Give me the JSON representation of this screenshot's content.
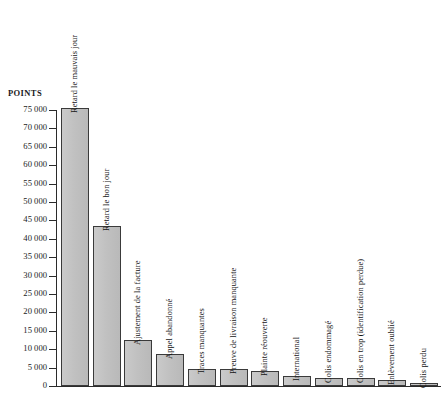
{
  "chart_data": {
    "type": "bar",
    "title": "",
    "subtitle": "",
    "xlabel": "",
    "ylabel": "POINTS",
    "ylim": [
      0,
      75000
    ],
    "ytick_step": 5000,
    "grid": false,
    "legend": null,
    "orientation": "vertical",
    "bar_color": "#c3c3c3",
    "bar_border_color": "#3a3a3a",
    "background_color": "#ffffff",
    "label_rotation": -90,
    "ytick_labels": [
      "0",
      "5 000",
      "10 000",
      "15 000",
      "20 000",
      "25 000",
      "30 000",
      "35 000",
      "40 000",
      "45 000",
      "50 000",
      "55 000",
      "60 000",
      "65 000",
      "70 000",
      "75 000"
    ],
    "ytick_values": [
      0,
      5000,
      10000,
      15000,
      20000,
      25000,
      30000,
      35000,
      40000,
      45000,
      50000,
      55000,
      60000,
      65000,
      70000,
      75000
    ],
    "categories": [
      "Retard le mauvais jour",
      "Retard le bon jour",
      "Ajustement  de la facture",
      "Appel abandonné",
      "Traces manquantes",
      "Preuve de livraison manquante",
      "Plainte réouverte",
      "International",
      "Colis endommagé",
      "Colis en trop (identification perdue)",
      "Enlèvement oublié",
      "Colis perdu"
    ],
    "values": [
      75500,
      43500,
      12500,
      8800,
      4700,
      4700,
      4100,
      2700,
      2200,
      2200,
      1500,
      800
    ]
  }
}
